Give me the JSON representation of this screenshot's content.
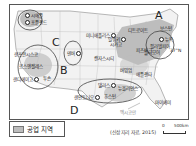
{
  "map": {
    "title": "미국의 공업 지역",
    "regions": [
      {
        "id": "A",
        "label": "A"
      },
      {
        "id": "B",
        "label": "B"
      },
      {
        "id": "C",
        "label": "C"
      },
      {
        "id": "D",
        "label": "D"
      }
    ],
    "cities": [
      {
        "name": "시애틀"
      },
      {
        "name": "포틀랜드"
      },
      {
        "name": "미니애폴리스"
      },
      {
        "name": "덴버"
      },
      {
        "name": "샌프란시스코"
      },
      {
        "name": "로스앤젤레스"
      },
      {
        "name": "샌디에이고"
      },
      {
        "name": "투손"
      },
      {
        "name": "밀워키"
      },
      {
        "name": "시카고"
      },
      {
        "name": "디트로이트"
      },
      {
        "name": "캔자스시티"
      },
      {
        "name": "피츠버그"
      },
      {
        "name": "보스턴"
      },
      {
        "name": "뉴욕"
      },
      {
        "name": "필라델피아"
      },
      {
        "name": "볼티모어"
      },
      {
        "name": "애틀랜타"
      },
      {
        "name": "버밍엄"
      },
      {
        "name": "댈러스"
      },
      {
        "name": "휴스턴"
      },
      {
        "name": "뉴올리언스"
      },
      {
        "name": "샌안토니오"
      },
      {
        "name": "마이애미"
      }
    ],
    "water_labels": {
      "gulf": "멕시코만",
      "lat": "37°N"
    }
  },
  "legend": {
    "industrial_area": "공업 지역",
    "swatch_color": "#bdbdbd"
  },
  "source": "(신상 지리 자료, 2015)",
  "scale": {
    "zero": "0",
    "max": "500km"
  }
}
